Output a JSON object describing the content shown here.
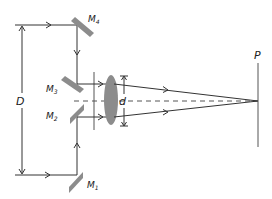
{
  "diagram": {
    "labels": {
      "m1": "M",
      "m1_sub": "1",
      "m2": "M",
      "m2_sub": "2",
      "m3": "M",
      "m3_sub": "3",
      "m4": "M",
      "m4_sub": "4",
      "outer_separation": "D",
      "inner_separation": "d",
      "screen": "P"
    },
    "colors": {
      "line": "#333333",
      "mirror": "#8c8c8c",
      "lens": "#8c8c8c",
      "axis": "#555555"
    }
  }
}
